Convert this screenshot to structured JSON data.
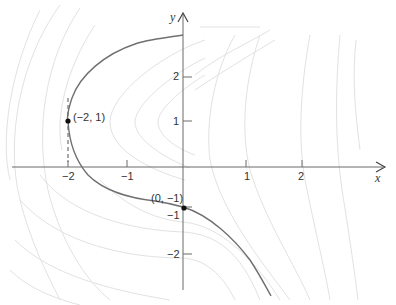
{
  "axes": {
    "x_label": "x",
    "y_label": "y",
    "x_ticks": [
      "−2",
      "−1",
      "1",
      "2"
    ],
    "y_ticks": [
      "2",
      "1",
      "−1",
      "−2"
    ]
  },
  "points": [
    {
      "label": "(−2, 1)",
      "x": -2,
      "y": 1
    },
    {
      "label": "(0, −1)",
      "x": 0,
      "y": -1
    }
  ],
  "annotations": {
    "vertical_tangent": "dashed vertical line at x = −2 through (−2, 1)"
  },
  "colors": {
    "solution_curve": "#707070",
    "contours": "#e2e2e2",
    "axes": "#6a6a6a"
  }
}
